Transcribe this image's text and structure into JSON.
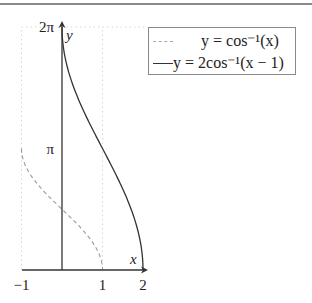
{
  "header": {
    "partial_text": ""
  },
  "chart_data": {
    "type": "line",
    "title": "",
    "xlabel": "x",
    "ylabel": "y",
    "xlim": [
      -1,
      2
    ],
    "ylim": [
      0,
      6.283185307
    ],
    "xticks": [
      {
        "value": -1,
        "label": "−1"
      },
      {
        "value": 1,
        "label": "1"
      },
      {
        "value": 2,
        "label": "2"
      }
    ],
    "yticks": [
      {
        "value": 3.141592654,
        "label": "π"
      },
      {
        "value": 6.283185307,
        "label": "2π"
      }
    ],
    "grid": "dotted at x=-1, x=1, y=2π",
    "legend_position": "top-right",
    "series": [
      {
        "name": "y = cos⁻¹(x)",
        "legend_label": "y = cos⁻¹(x)",
        "style": "dashed",
        "color": "#9a9a9a",
        "function": "arccos(x)",
        "domain": [
          -1,
          1
        ],
        "x": [
          -1,
          -0.75,
          -0.5,
          -0.25,
          0,
          0.25,
          0.5,
          0.75,
          1
        ],
        "y": [
          3.1416,
          2.4189,
          2.0944,
          1.8235,
          1.5708,
          1.3181,
          1.0472,
          0.7227,
          0
        ]
      },
      {
        "name": "y = 2cos⁻¹(x−1)",
        "legend_label": "y = 2cos⁻¹(x − 1)",
        "style": "solid",
        "color": "#333333",
        "function": "2*arccos(x-1)",
        "domain": [
          0,
          2
        ],
        "x": [
          0,
          0.25,
          0.5,
          0.75,
          1,
          1.25,
          1.5,
          1.75,
          2
        ],
        "y": [
          6.2832,
          4.8378,
          4.1888,
          3.6469,
          3.1416,
          2.6362,
          2.0944,
          1.4454,
          0
        ]
      }
    ]
  }
}
